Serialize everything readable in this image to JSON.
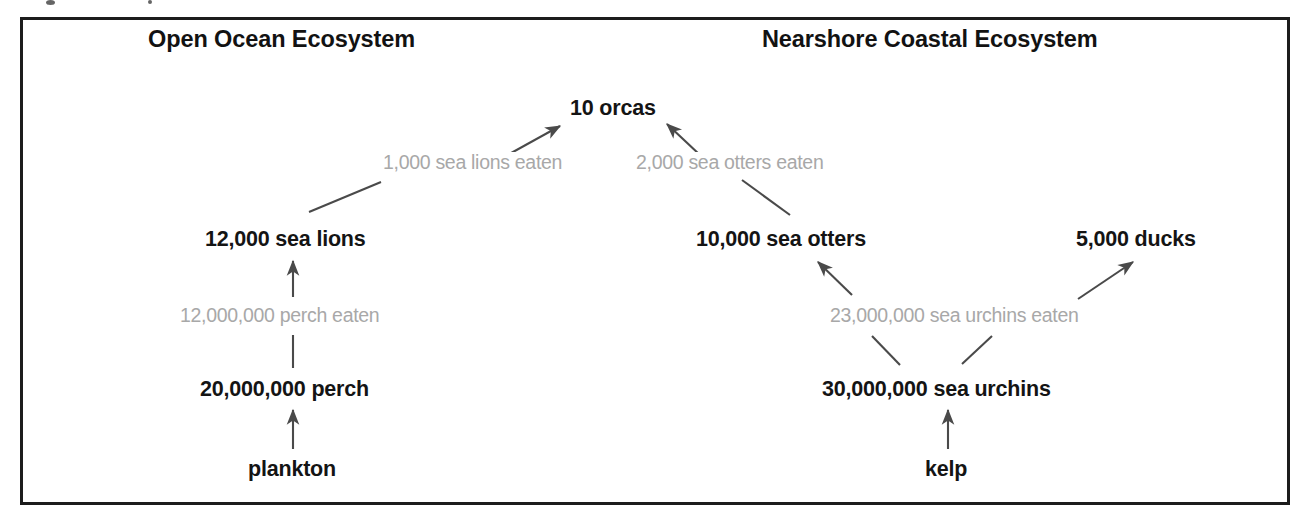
{
  "diagram": {
    "title_left": "Open Ocean Ecosystem",
    "title_right": "Nearshore Coastal Ecosystem",
    "colors": {
      "node_text": "#141414",
      "flow_label_text": "#a8a8a8",
      "arrow": "#4a4a4a",
      "frame_border": "#1c1c1c",
      "background": "#ffffff"
    },
    "nodes": [
      {
        "id": "orcas",
        "label": "10 orcas",
        "count": 10,
        "organism": "orcas",
        "trophic_level": 4,
        "ecosystem": "both"
      },
      {
        "id": "sea_lions",
        "label": "12,000 sea lions",
        "count": 12000,
        "organism": "sea lions",
        "trophic_level": 3,
        "ecosystem": "open-ocean"
      },
      {
        "id": "perch",
        "label": "20,000,000 perch",
        "count": 20000000,
        "organism": "perch",
        "trophic_level": 2,
        "ecosystem": "open-ocean"
      },
      {
        "id": "plankton",
        "label": "plankton",
        "count": null,
        "organism": "plankton",
        "trophic_level": 1,
        "ecosystem": "open-ocean"
      },
      {
        "id": "sea_otters",
        "label": "10,000 sea otters",
        "count": 10000,
        "organism": "sea otters",
        "trophic_level": 3,
        "ecosystem": "nearshore"
      },
      {
        "id": "ducks",
        "label": "5,000 ducks",
        "count": 5000,
        "organism": "ducks",
        "trophic_level": 3,
        "ecosystem": "nearshore"
      },
      {
        "id": "sea_urchins",
        "label": "30,000,000 sea urchins",
        "count": 30000000,
        "organism": "sea urchins",
        "trophic_level": 2,
        "ecosystem": "nearshore"
      },
      {
        "id": "kelp",
        "label": "kelp",
        "count": null,
        "organism": "kelp",
        "trophic_level": 1,
        "ecosystem": "nearshore"
      }
    ],
    "flows": [
      {
        "id": "flow_sea_lions_eaten",
        "label": "1,000 sea lions eaten",
        "amount": 1000,
        "prey": "sea lions",
        "from": "sea_lions",
        "to": "orcas"
      },
      {
        "id": "flow_sea_otters_eaten",
        "label": "2,000 sea otters eaten",
        "amount": 2000,
        "prey": "sea otters",
        "from": "sea_otters",
        "to": "orcas"
      },
      {
        "id": "flow_perch_eaten",
        "label": "12,000,000 perch eaten",
        "amount": 12000000,
        "prey": "perch",
        "from": "perch",
        "to": "sea_lions"
      },
      {
        "id": "flow_urchins_eaten",
        "label": "23,000,000 sea urchins eaten",
        "amount": 23000000,
        "prey": "sea urchins",
        "from": "sea_urchins",
        "to": "sea_otters, ducks"
      },
      {
        "id": "flow_plankton",
        "label": "",
        "amount": null,
        "prey": "plankton",
        "from": "plankton",
        "to": "perch"
      },
      {
        "id": "flow_kelp",
        "label": "",
        "amount": null,
        "prey": "kelp",
        "from": "kelp",
        "to": "sea_urchins"
      }
    ]
  }
}
